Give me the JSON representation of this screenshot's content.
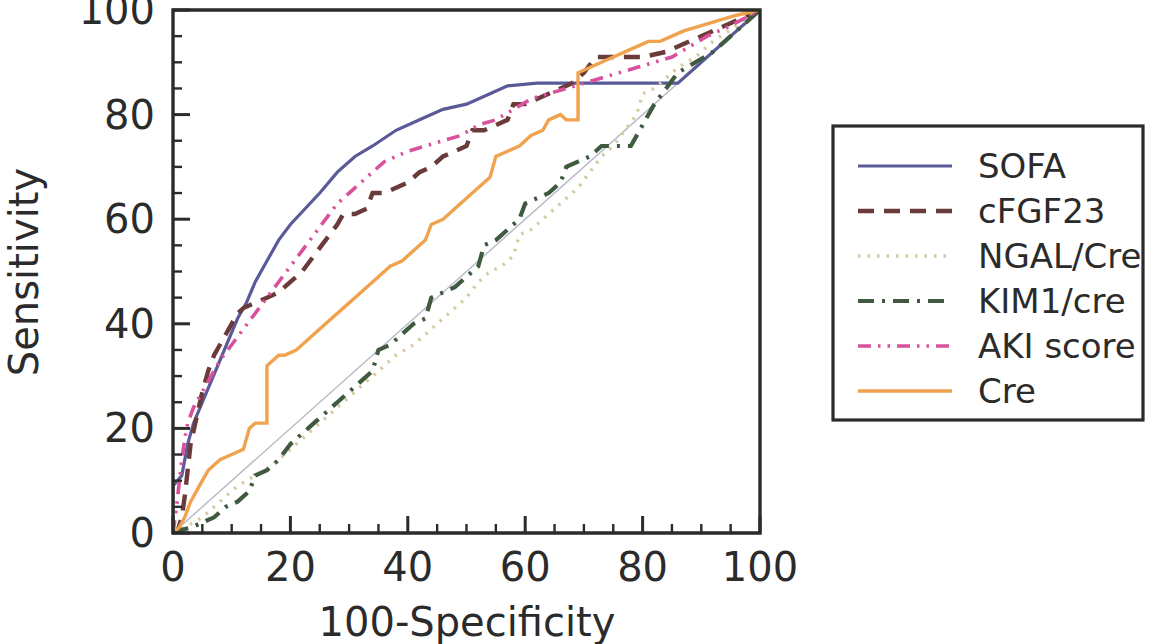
{
  "chart_data": {
    "type": "line",
    "title": "",
    "xlabel": "100-Specificity",
    "ylabel": "Sensitivity",
    "xlim": [
      0,
      100
    ],
    "ylim": [
      0,
      100
    ],
    "xticks": [
      0,
      20,
      40,
      60,
      80,
      100
    ],
    "yticks": [
      0,
      20,
      40,
      60,
      80,
      100
    ],
    "xtick_labels": [
      "0",
      "20",
      "40",
      "60",
      "80",
      "100"
    ],
    "ytick_labels": [
      "0",
      "20",
      "40",
      "60",
      "80",
      "100"
    ],
    "minor_tick_step": 5,
    "grid": false,
    "legend_position": "right-outside",
    "reference_line": {
      "name": "chance-diagonal",
      "points": [
        [
          0,
          0
        ],
        [
          100,
          100
        ]
      ],
      "color": "#b9b9c6",
      "style": "solid-thin"
    },
    "series": [
      {
        "name": "SOFA",
        "color": "#5a5a99",
        "dash": "solid",
        "width": 3.2,
        "points": [
          [
            0,
            0
          ],
          [
            0,
            9
          ],
          [
            1.5,
            11
          ],
          [
            2.5,
            17
          ],
          [
            3.5,
            21
          ],
          [
            5,
            25
          ],
          [
            6.5,
            29
          ],
          [
            8,
            33
          ],
          [
            9.5,
            37
          ],
          [
            11,
            41
          ],
          [
            12.5,
            44
          ],
          [
            14,
            48
          ],
          [
            16,
            52
          ],
          [
            18,
            56
          ],
          [
            20,
            59
          ],
          [
            22.5,
            62
          ],
          [
            25,
            65
          ],
          [
            28,
            69
          ],
          [
            31,
            72
          ],
          [
            34,
            74
          ],
          [
            38,
            77
          ],
          [
            42,
            79
          ],
          [
            46,
            81
          ],
          [
            50,
            82
          ],
          [
            54,
            84
          ],
          [
            57,
            85.5
          ],
          [
            62,
            86
          ],
          [
            70,
            86
          ],
          [
            78,
            86
          ],
          [
            86,
            86
          ],
          [
            90,
            90
          ],
          [
            94,
            94
          ],
          [
            97,
            97
          ],
          [
            100,
            100
          ]
        ]
      },
      {
        "name": "cFGF23",
        "color": "#6b3b3b",
        "dash": "dashed",
        "width": 4.4,
        "points": [
          [
            0,
            0
          ],
          [
            0.8,
            0.5
          ],
          [
            1.5,
            3
          ],
          [
            2,
            7
          ],
          [
            2.5,
            12
          ],
          [
            3,
            17
          ],
          [
            4,
            22
          ],
          [
            5,
            27
          ],
          [
            6,
            31
          ],
          [
            7,
            34
          ],
          [
            8,
            36
          ],
          [
            9,
            38
          ],
          [
            10,
            40
          ],
          [
            11,
            42
          ],
          [
            12,
            43
          ],
          [
            14,
            44
          ],
          [
            16,
            45
          ],
          [
            18,
            46
          ],
          [
            20,
            48
          ],
          [
            22,
            50
          ],
          [
            24,
            53
          ],
          [
            26,
            56
          ],
          [
            28,
            59
          ],
          [
            29,
            61
          ],
          [
            31,
            61
          ],
          [
            33,
            62
          ],
          [
            34,
            65
          ],
          [
            36,
            65
          ],
          [
            38,
            66
          ],
          [
            40,
            67
          ],
          [
            42,
            69
          ],
          [
            44,
            70
          ],
          [
            46,
            72
          ],
          [
            48,
            73
          ],
          [
            50,
            74
          ],
          [
            51,
            77
          ],
          [
            53,
            77
          ],
          [
            55,
            78
          ],
          [
            57,
            79
          ],
          [
            58,
            82
          ],
          [
            60,
            82
          ],
          [
            62,
            83
          ],
          [
            64,
            84
          ],
          [
            66,
            85
          ],
          [
            68,
            86
          ],
          [
            70,
            88
          ],
          [
            72,
            91
          ],
          [
            74,
            91
          ],
          [
            77,
            91
          ],
          [
            80,
            91
          ],
          [
            84,
            92
          ],
          [
            88,
            94
          ],
          [
            92,
            96
          ],
          [
            96,
            98
          ],
          [
            100,
            100
          ]
        ]
      },
      {
        "name": "NGAL/Cre",
        "color": "#d6c9a0",
        "dash": "dotted",
        "width": 3.4,
        "points": [
          [
            0,
            0
          ],
          [
            2,
            1
          ],
          [
            5,
            3
          ],
          [
            8,
            6
          ],
          [
            11,
            9
          ],
          [
            14,
            11
          ],
          [
            17,
            13
          ],
          [
            20,
            16
          ],
          [
            23,
            19
          ],
          [
            26,
            22
          ],
          [
            29,
            25
          ],
          [
            32,
            28
          ],
          [
            35,
            31
          ],
          [
            38,
            34
          ],
          [
            41,
            36
          ],
          [
            44,
            39
          ],
          [
            47,
            42
          ],
          [
            50,
            45
          ],
          [
            52,
            48
          ],
          [
            54,
            50
          ],
          [
            56,
            51
          ],
          [
            58,
            53
          ],
          [
            59,
            57
          ],
          [
            61,
            58
          ],
          [
            63,
            60
          ],
          [
            65,
            62
          ],
          [
            67,
            64
          ],
          [
            69,
            66
          ],
          [
            71,
            69
          ],
          [
            73,
            72
          ],
          [
            75,
            74
          ],
          [
            77,
            77
          ],
          [
            79,
            80
          ],
          [
            80,
            84
          ],
          [
            82,
            85
          ],
          [
            84,
            87
          ],
          [
            86,
            89
          ],
          [
            89,
            91
          ],
          [
            92,
            94
          ],
          [
            96,
            97
          ],
          [
            100,
            100
          ]
        ]
      },
      {
        "name": "KIM1/cre",
        "color": "#3f5a3f",
        "dash": "dashdot",
        "width": 4.2,
        "points": [
          [
            0,
            0
          ],
          [
            1,
            0.5
          ],
          [
            3,
            1
          ],
          [
            5,
            2
          ],
          [
            7,
            3
          ],
          [
            9,
            5
          ],
          [
            11,
            6
          ],
          [
            13,
            8
          ],
          [
            14,
            11
          ],
          [
            16,
            12
          ],
          [
            18,
            14
          ],
          [
            20,
            17
          ],
          [
            22,
            19
          ],
          [
            24,
            21
          ],
          [
            26,
            23
          ],
          [
            28,
            25
          ],
          [
            30,
            27
          ],
          [
            32,
            29
          ],
          [
            34,
            31
          ],
          [
            35,
            35
          ],
          [
            37,
            36
          ],
          [
            39,
            38
          ],
          [
            41,
            40
          ],
          [
            43,
            41
          ],
          [
            44,
            45
          ],
          [
            46,
            46
          ],
          [
            48,
            47
          ],
          [
            50,
            49
          ],
          [
            52,
            51
          ],
          [
            53,
            55
          ],
          [
            55,
            56
          ],
          [
            57,
            58
          ],
          [
            59,
            60
          ],
          [
            60,
            63
          ],
          [
            62,
            64
          ],
          [
            64,
            65
          ],
          [
            66,
            67
          ],
          [
            67,
            70
          ],
          [
            69,
            71
          ],
          [
            71,
            72
          ],
          [
            73,
            74
          ],
          [
            75,
            74
          ],
          [
            78,
            74
          ],
          [
            80,
            78
          ],
          [
            82,
            82
          ],
          [
            84,
            85
          ],
          [
            86,
            88
          ],
          [
            89,
            90
          ],
          [
            92,
            92
          ],
          [
            95,
            95
          ],
          [
            100,
            100
          ]
        ]
      },
      {
        "name": "AKI score",
        "color": "#d9519c",
        "dash": "dashdotdot",
        "width": 3.6,
        "points": [
          [
            0,
            0
          ],
          [
            0.5,
            4
          ],
          [
            1,
            9
          ],
          [
            1.5,
            14
          ],
          [
            2,
            18
          ],
          [
            2.5,
            21
          ],
          [
            3.5,
            24
          ],
          [
            5,
            27
          ],
          [
            6.5,
            30
          ],
          [
            8,
            33
          ],
          [
            10,
            36
          ],
          [
            12,
            39
          ],
          [
            14,
            42
          ],
          [
            16,
            45
          ],
          [
            18,
            48
          ],
          [
            20,
            51
          ],
          [
            22,
            54
          ],
          [
            24,
            57
          ],
          [
            26,
            60
          ],
          [
            28,
            63
          ],
          [
            30,
            65
          ],
          [
            32,
            67
          ],
          [
            34,
            69
          ],
          [
            36,
            71
          ],
          [
            38,
            72
          ],
          [
            40,
            73
          ],
          [
            43,
            74
          ],
          [
            46,
            75
          ],
          [
            49,
            76
          ],
          [
            52,
            78
          ],
          [
            55,
            79
          ],
          [
            58,
            81
          ],
          [
            61,
            83
          ],
          [
            64,
            84
          ],
          [
            67,
            85
          ],
          [
            70,
            86
          ],
          [
            73,
            87
          ],
          [
            76,
            88
          ],
          [
            79,
            89
          ],
          [
            82,
            90
          ],
          [
            85,
            91
          ],
          [
            88,
            93
          ],
          [
            91,
            95
          ],
          [
            95,
            97
          ],
          [
            100,
            100
          ]
        ]
      },
      {
        "name": "Cre",
        "color": "#f0a24e",
        "dash": "solid",
        "width": 3.4,
        "points": [
          [
            0,
            0
          ],
          [
            1,
            1
          ],
          [
            2,
            3
          ],
          [
            3,
            6
          ],
          [
            4,
            8
          ],
          [
            5,
            10
          ],
          [
            6,
            12
          ],
          [
            7,
            13
          ],
          [
            8,
            14
          ],
          [
            10,
            15
          ],
          [
            12,
            16
          ],
          [
            13,
            20
          ],
          [
            14,
            21
          ],
          [
            15,
            21
          ],
          [
            16,
            21
          ],
          [
            16,
            32
          ],
          [
            17,
            33
          ],
          [
            18,
            34
          ],
          [
            19,
            34
          ],
          [
            21,
            35
          ],
          [
            23,
            37
          ],
          [
            25,
            39
          ],
          [
            27,
            41
          ],
          [
            29,
            43
          ],
          [
            31,
            45
          ],
          [
            33,
            47
          ],
          [
            35,
            49
          ],
          [
            37,
            51
          ],
          [
            39,
            52
          ],
          [
            41,
            54
          ],
          [
            43,
            56
          ],
          [
            44,
            59
          ],
          [
            46,
            60
          ],
          [
            48,
            62
          ],
          [
            50,
            64
          ],
          [
            52,
            66
          ],
          [
            54,
            68
          ],
          [
            55,
            72
          ],
          [
            57,
            73
          ],
          [
            59,
            74
          ],
          [
            61,
            76
          ],
          [
            63,
            77
          ],
          [
            64,
            79
          ],
          [
            66,
            80
          ],
          [
            67,
            79
          ],
          [
            68,
            79
          ],
          [
            69,
            79
          ],
          [
            69,
            88
          ],
          [
            71,
            89
          ],
          [
            73,
            90
          ],
          [
            75,
            91
          ],
          [
            77,
            92
          ],
          [
            79,
            93
          ],
          [
            81,
            94
          ],
          [
            83,
            94
          ],
          [
            85,
            95
          ],
          [
            87,
            96
          ],
          [
            90,
            97
          ],
          [
            93,
            98
          ],
          [
            96,
            99
          ],
          [
            100,
            100
          ]
        ]
      }
    ]
  },
  "legend": {
    "items": [
      {
        "label": "SOFA"
      },
      {
        "label": "cFGF23"
      },
      {
        "label": "NGAL/Cre"
      },
      {
        "label": "KIM1/cre"
      },
      {
        "label": "AKI score"
      },
      {
        "label": "Cre"
      }
    ]
  }
}
